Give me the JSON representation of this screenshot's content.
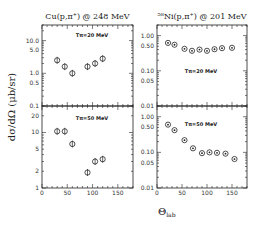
{
  "chart_data": [
    {
      "type": "scatter",
      "panel": "top-left",
      "title": "Cu(p,π⁺) @ 248 MeV",
      "annotation": "Tπ=20 MeV",
      "xlabel": "θlab",
      "ylabel": "dσ/dΩ (μb/sr)",
      "yscale": "log",
      "xlim": [
        0,
        180
      ],
      "ylim": [
        0.1,
        30
      ],
      "yticks": [
        "10.0",
        "5.0",
        "1.0",
        "0.5",
        "0.1"
      ],
      "series": [
        {
          "name": "Cu Tπ=20 MeV",
          "x": [
            30,
            45,
            60,
            90,
            105,
            120
          ],
          "y": [
            2.5,
            1.6,
            1.0,
            1.6,
            2.0,
            2.8
          ]
        }
      ]
    },
    {
      "type": "scatter",
      "panel": "bottom-left",
      "title": "",
      "annotation": "Tπ=50 MeV",
      "xlabel": "θlab",
      "ylabel": "dσ/dΩ (μb/sr)",
      "yscale": "log",
      "xlim": [
        0,
        180
      ],
      "ylim": [
        1,
        30
      ],
      "xticks": [
        "0",
        "50",
        "100",
        "150"
      ],
      "yticks": [
        "20",
        "10",
        "5",
        "2",
        "1"
      ],
      "series": [
        {
          "name": "Cu Tπ=50 MeV",
          "x": [
            30,
            45,
            60,
            90,
            105,
            120
          ],
          "y": [
            10.5,
            10.5,
            6.2,
            1.9,
            3.0,
            3.3
          ]
        }
      ]
    },
    {
      "type": "scatter",
      "panel": "top-right",
      "title": "⁵⁸Ni(p,π⁺) @ 201 MeV",
      "annotation": "Tπ=20 MeV",
      "xlabel": "θlab",
      "yscale": "log",
      "xlim": [
        0,
        180
      ],
      "ylim": [
        0.01,
        2
      ],
      "yticks": [
        "1.00",
        "0.50",
        "0.10",
        "0.05",
        "0.01"
      ],
      "series": [
        {
          "name": "Ni Tπ=20 MeV",
          "x": [
            22,
            35,
            55,
            70,
            85,
            100,
            115,
            130,
            150
          ],
          "y": [
            0.62,
            0.55,
            0.42,
            0.37,
            0.4,
            0.37,
            0.41,
            0.44,
            0.45
          ]
        }
      ]
    },
    {
      "type": "scatter",
      "panel": "bottom-right",
      "title": "",
      "annotation": "Tπ=50 MeV",
      "xlabel": "θlab",
      "yscale": "log",
      "xlim": [
        0,
        180
      ],
      "ylim": [
        0.01,
        2
      ],
      "xticks": [
        "0",
        "50",
        "100",
        "150"
      ],
      "yticks": [
        "1.00",
        "0.50",
        "0.10",
        "0.05",
        "0.01"
      ],
      "series": [
        {
          "name": "Ni Tπ=50 MeV",
          "x": [
            22,
            35,
            55,
            72,
            90,
            105,
            120,
            137,
            155
          ],
          "y": [
            0.6,
            0.42,
            0.22,
            0.13,
            0.095,
            0.1,
            0.097,
            0.092,
            0.065
          ]
        }
      ]
    }
  ],
  "labels": {
    "title_left": "Cu(p,π⁺) @ 248 MeV",
    "title_right": "⁵⁸Ni(p,π⁺) @ 201 MeV",
    "ylabel": "dσ/dΩ (μb/sr)",
    "xlabel_main": "Θ",
    "xlabel_sub": "lab",
    "annot_20": "Tπ=20 MeV",
    "annot_50": "Tπ=50 MeV"
  }
}
